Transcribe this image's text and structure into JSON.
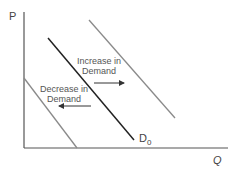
{
  "diagram": {
    "y_axis_label": "P",
    "x_axis_label": "Q",
    "curves": [
      {
        "name": "D0",
        "label_main": "D",
        "label_sub": "0",
        "color": "#222222",
        "x1": 48,
        "y1": 38,
        "x2": 134,
        "y2": 140
      },
      {
        "name": "increase",
        "color": "#8a8a8a",
        "x1": 89,
        "y1": 20,
        "x2": 175,
        "y2": 118
      },
      {
        "name": "decrease",
        "color": "#8a8a8a",
        "x1": 24,
        "y1": 78,
        "x2": 77,
        "y2": 148
      }
    ],
    "annotations": {
      "increase": {
        "line1": "Increase in",
        "line2": "Demand",
        "arrow_direction": "right"
      },
      "decrease": {
        "line1": "Decrease in",
        "line2": "Demand",
        "arrow_direction": "left"
      }
    }
  }
}
